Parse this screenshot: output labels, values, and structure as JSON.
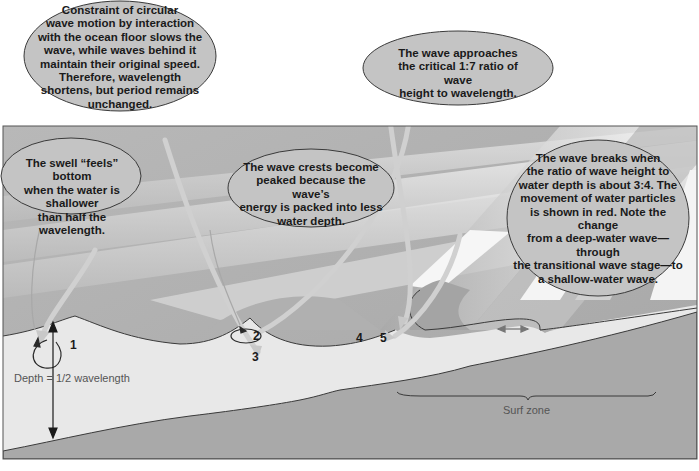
{
  "diagram": {
    "callouts": {
      "constraint": "Constraint of circular wave motion by interaction with the ocean floor slows the wave, while waves behind it maintain their original speed. Therefore, wavelength shortens, but period remains unchanged.",
      "approaches": "The wave approaches the critical 1:7 ratio of wave height to wavelength.",
      "swell": "The swell “feels” bottom when the water is shallower than half the wavelength.",
      "crests": "The wave crests become peaked because the wave’s energy is packed into less water depth.",
      "breaks": "The wave breaks when the ratio of wave height to water depth is about 3:4. The movement of water particles is shown in red. Note the change from a deep-water wave—through the transitional wave stage—to a shallow-water wave."
    },
    "callout_lines": {
      "constraint": [
        "Constraint of circular",
        "wave motion by interaction",
        "with the ocean floor slows the",
        "wave, while waves behind it",
        "maintain their original speed.",
        "Therefore, wavelength",
        "shortens, but period remains",
        "unchanged."
      ],
      "approaches": [
        "The wave approaches",
        "the critical 1:7 ratio of wave",
        "height to wavelength."
      ],
      "swell": [
        "The swell “feels” bottom",
        "when the water is shallower",
        "than half the wavelength."
      ],
      "crests": [
        "The wave crests become",
        "peaked because the wave’s",
        "energy is packed into less",
        "water depth."
      ],
      "breaks": [
        "The wave breaks when",
        "the ratio of wave height to",
        "water depth is about 3:4. The",
        "movement of water particles",
        "is shown in red. Note the change",
        "from a deep-water wave—through",
        "the transitional wave stage—to",
        "a shallow-water wave."
      ]
    },
    "stage_numbers": [
      "1",
      "2",
      "3",
      "4",
      "5"
    ],
    "depth_label": "Depth = 1/2 wavelength",
    "surf_zone_label": "Surf zone",
    "colors": {
      "sky": "#b4b4b4",
      "wave_light": "#e6e6e6",
      "wave_mid": "#c8c8c8",
      "water": "#e8e8e8",
      "seafloor": "#a9a9a9",
      "bubble_fill": "#c4c4c4",
      "outline": "#3a3a3a",
      "arrow": "#c9c9c9"
    }
  }
}
